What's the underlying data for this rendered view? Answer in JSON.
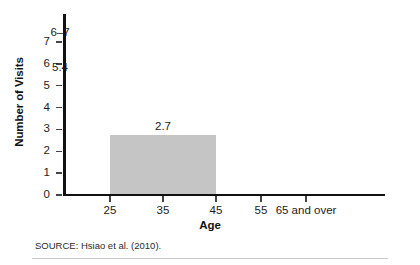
{
  "chart_data": {
    "type": "bar",
    "title": "",
    "xlabel": "Age",
    "ylabel": "Number of Visits",
    "categories": [
      "25",
      "35",
      "45",
      "55",
      "65 and over"
    ],
    "bars": [
      {
        "label": "25-44",
        "value_label": "2.7",
        "value": 2.7,
        "start_tick": "25",
        "end_tick": "45",
        "color": "#c5c5c5"
      },
      {
        "label": "45-64",
        "value_label": "5.4",
        "value": 5.4,
        "start_tick": "45",
        "end_tick": "65",
        "color": "#3a3a3a"
      },
      {
        "label": "65 and over",
        "value_label": "6–7",
        "value": 7,
        "start_tick": "65",
        "end_tick": "",
        "color": "#151515"
      }
    ],
    "ylim": [
      0,
      7
    ],
    "yticks": [
      "0",
      "1",
      "2",
      "3",
      "4",
      "5",
      "6",
      "7"
    ],
    "grid": false,
    "legend": "none"
  },
  "source": {
    "text": "SOURCE: Hsiao et al. (2010)."
  }
}
